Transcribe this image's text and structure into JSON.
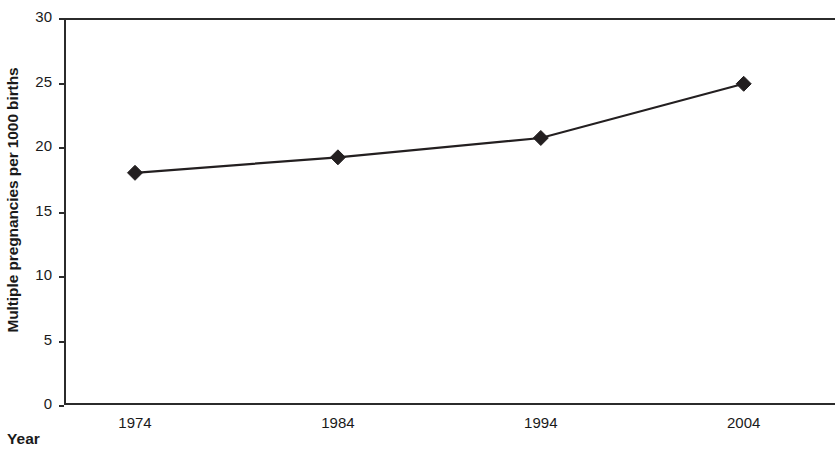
{
  "chart_data": {
    "type": "line",
    "title": "",
    "xlabel": "Year",
    "ylabel": "Multiple pregnancies per 1000 births",
    "x": [
      1974,
      1984,
      1994,
      2004
    ],
    "categories": [
      "1974",
      "1984",
      "1994",
      "2004"
    ],
    "values": [
      18.0,
      19.2,
      20.7,
      24.9
    ],
    "series": [
      {
        "name": "Multiple pregnancy rate",
        "values": [
          18.0,
          19.2,
          20.7,
          24.9
        ]
      }
    ],
    "xlim": [
      1970.5,
      2008.5
    ],
    "ylim": [
      0,
      30
    ],
    "ytick_labels": [
      "30",
      "25",
      "20",
      "15",
      "10",
      "5",
      "0"
    ],
    "ytick_values": [
      30,
      25,
      20,
      15,
      10,
      5,
      0
    ],
    "xtick_labels": [
      "1974",
      "1984",
      "1994",
      "2004"
    ],
    "xtick_values": [
      1974,
      1984,
      1994,
      2004
    ],
    "grid": false,
    "legend": "none",
    "marker": "diamond",
    "line_color": "#231f20",
    "marker_color": "#231f20",
    "axis_color": "#2b2b2b",
    "background_color": "#ffffff"
  },
  "axes": {
    "y_title": "Multiple pregnancies per 1000 births",
    "x_title": "Year"
  }
}
